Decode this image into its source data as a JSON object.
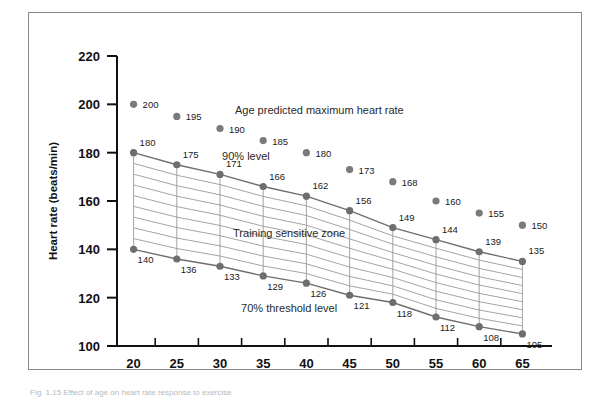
{
  "figure": {
    "caption": "Fig. 1.15 Effect of age on heart rate response to exercise"
  },
  "chart_data": {
    "type": "line",
    "title": "",
    "xlabel": "Age (years)",
    "ylabel": "Heart rate (beats/min)",
    "x": [
      20,
      25,
      30,
      35,
      40,
      45,
      50,
      55,
      60,
      65
    ],
    "xlim": [
      17.5,
      67.5
    ],
    "ylim": [
      100,
      220
    ],
    "yticks": [
      100,
      120,
      140,
      160,
      180,
      200,
      220
    ],
    "xticks": [
      20,
      25,
      30,
      35,
      40,
      45,
      50,
      55,
      60,
      65
    ],
    "grid": false,
    "legend": "none",
    "series": [
      {
        "name": "Age predicted maximum heart rate",
        "values": [
          200,
          195,
          190,
          185,
          180,
          173,
          168,
          160,
          155,
          150
        ],
        "style": "markers-only",
        "color": "#7a7a7a"
      },
      {
        "name": "90% level",
        "values": [
          180,
          175,
          171,
          166,
          162,
          156,
          149,
          144,
          139,
          135
        ],
        "style": "line-markers",
        "color": "#6e6e6e"
      },
      {
        "name": "70% threshold level",
        "values": [
          140,
          136,
          133,
          129,
          126,
          121,
          118,
          112,
          108,
          105
        ],
        "style": "line-markers",
        "color": "#6e6e6e"
      }
    ],
    "annotations": [
      {
        "text": "Age predicted maximum heart rate",
        "x": 41.5,
        "y": 196
      },
      {
        "text": "90% level",
        "x": 33.0,
        "y": 177
      },
      {
        "text": "Training sensitive zone",
        "x": 38.0,
        "y": 145
      },
      {
        "text": "70% threshold level",
        "x": 38.0,
        "y": 114
      }
    ]
  },
  "colors": {
    "marker": "#7a7a7a",
    "line": "#6e6e6e",
    "hatch": "#9a9a9a",
    "axis": "#111111",
    "frame": "#8a8a8a",
    "text": "#111111"
  }
}
